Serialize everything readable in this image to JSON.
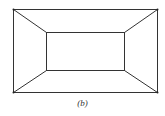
{
  "figure": {
    "caption": "(b)",
    "stroke_color": "#333333",
    "outer_rect": {
      "x1": 13,
      "y1": 9,
      "x2": 157,
      "y2": 92
    },
    "inner_rect": {
      "x1": 46,
      "y1": 32,
      "x2": 124,
      "y2": 70
    }
  }
}
